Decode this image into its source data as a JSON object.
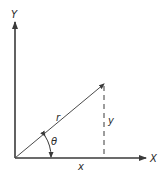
{
  "diagram": {
    "type": "polar-coordinates",
    "colors": {
      "stroke": "#3a3a3a",
      "text": "#2a2a2a",
      "background": "#ffffff"
    },
    "axes": {
      "x_label": "X",
      "y_label": "Y"
    },
    "vector": {
      "label": "r"
    },
    "components": {
      "x_label": "x",
      "y_label": "y"
    },
    "angle": {
      "label": "θ"
    }
  }
}
